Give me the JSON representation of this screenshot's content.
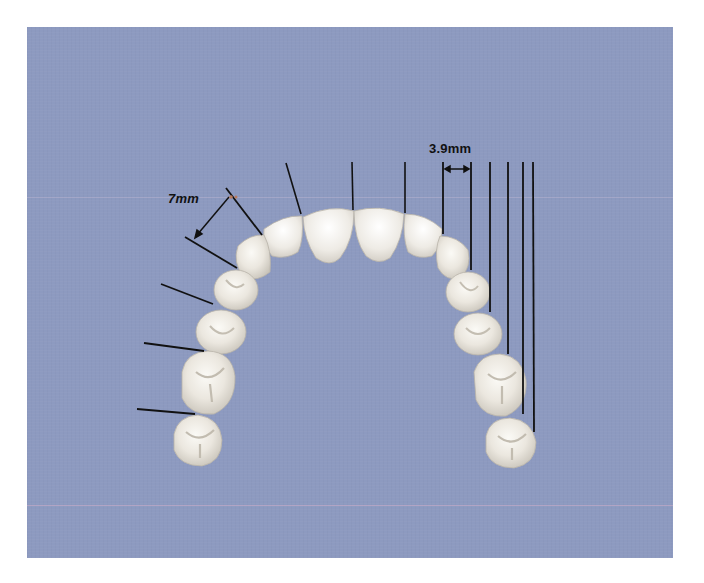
{
  "figure": {
    "type": "dental arch measurement diagram (maxillary arch, occlusal view)",
    "background_color": "#8d9ac0",
    "tooth_color": "#eeeae3",
    "line_color": "#111111"
  },
  "labels": {
    "left_measure": "7mm",
    "right_measure": "3.9mm"
  },
  "left_side": {
    "measure_annotation": "7mm",
    "leader_lines": 6,
    "teeth": [
      "lateral incisor",
      "canine",
      "first premolar",
      "second premolar",
      "first molar",
      "second molar"
    ]
  },
  "right_side": {
    "measure_annotation": "3.9mm",
    "vertical_rulers": 6,
    "teeth": [
      "lateral incisor",
      "canine",
      "first premolar",
      "second premolar",
      "first molar",
      "second molar"
    ]
  },
  "front": {
    "teeth": [
      "right central incisor",
      "left central incisor"
    ],
    "vertical_rulers": 3
  }
}
